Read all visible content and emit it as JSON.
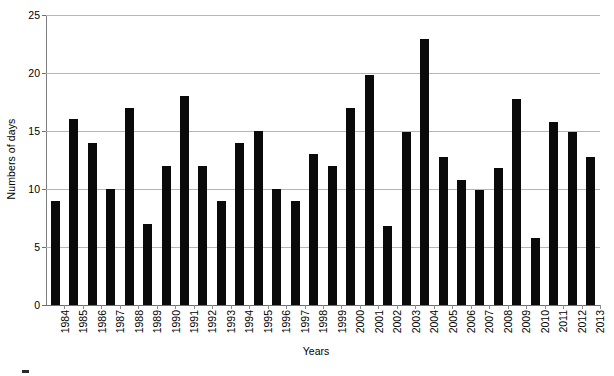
{
  "chart_data": {
    "type": "bar",
    "title": "",
    "xlabel": "Years",
    "ylabel": "Numbers of days",
    "categories": [
      "1984",
      "1985",
      "1986",
      "1987",
      "1988",
      "1989",
      "1990",
      "1991",
      "1992",
      "1993",
      "1994",
      "1995",
      "1996",
      "1997",
      "1998",
      "1999",
      "2000",
      "2001",
      "2002",
      "2003",
      "2004",
      "2005",
      "2006",
      "2007",
      "2008",
      "2009",
      "2010",
      "2011",
      "2012",
      "2013"
    ],
    "values": [
      9,
      16,
      14,
      10,
      17,
      7,
      12,
      18,
      12,
      9,
      14,
      15,
      10,
      9,
      13,
      12,
      17,
      19.8,
      6.8,
      14.9,
      22.9,
      12.8,
      10.8,
      9.9,
      11.8,
      17.8,
      5.8,
      15.8,
      14.9,
      12.8
    ],
    "series": [
      {
        "name": "Numbers of days",
        "values": [
          9,
          16,
          14,
          10,
          17,
          7,
          12,
          18,
          12,
          9,
          14,
          15,
          10,
          9,
          13,
          12,
          17,
          19.8,
          6.8,
          14.9,
          22.9,
          12.8,
          10.8,
          9.9,
          11.8,
          17.8,
          5.8,
          15.8,
          14.9,
          12.8
        ]
      }
    ],
    "ylim": [
      0,
      25
    ],
    "yticks": [
      0,
      5,
      10,
      15,
      20,
      25
    ],
    "ytick_labels": [
      "0",
      "5",
      "10",
      "15",
      "20",
      "25"
    ],
    "grid": "horizontal",
    "legend": "none",
    "bar_color": "#0a0a0a",
    "gridline_color": "#b6b6b6",
    "axis_color": "#6e6e6e"
  },
  "caption": {
    "text": ""
  }
}
